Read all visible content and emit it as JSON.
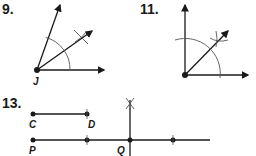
{
  "problems": [
    {
      "number": "9.",
      "vertex_label": "J",
      "description": "Angle bisector construction"
    },
    {
      "number": "11.",
      "description": "Right angle bisector construction"
    },
    {
      "number": "13.",
      "labels": {
        "c": "C",
        "d": "D",
        "p": "P",
        "q": "Q"
      },
      "description": "Copy segment CD onto line at P, construct perpendicular at Q"
    }
  ],
  "colors": {
    "ink": "#1a1a1a",
    "construction": "#555555"
  }
}
